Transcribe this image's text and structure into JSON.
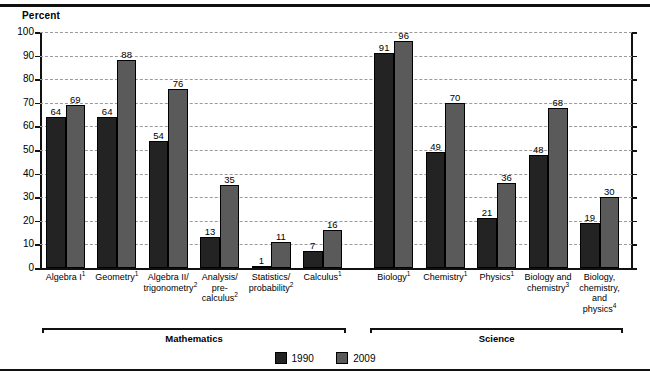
{
  "axis_title": "Percent",
  "legend": {
    "items": [
      {
        "label": "1990",
        "color": "#232323"
      },
      {
        "label": "2009",
        "color": "#5a5a5a"
      }
    ]
  },
  "groups": [
    {
      "name": "Mathematics"
    },
    {
      "name": "Science"
    }
  ],
  "chart_data": {
    "type": "bar",
    "title": "",
    "subtitle": "",
    "xlabel": "",
    "ylabel": "Percent",
    "ylim": [
      0,
      100
    ],
    "yticks": [
      0,
      10,
      20,
      30,
      40,
      50,
      60,
      70,
      80,
      90,
      100
    ],
    "grid": true,
    "legend_position": "bottom-center",
    "categories": [
      "Algebra I¹",
      "Geometry¹",
      "Algebra II/ trigonometry²",
      "Analysis/ pre- calculus²",
      "Statistics/ probability²",
      "Calculus¹",
      "Biology¹",
      "Chemistry¹",
      "Physics¹",
      "Biology and chemistry³",
      "Biology, chemistry, and physics⁴"
    ],
    "category_lines": [
      [
        "Algebra I",
        "1"
      ],
      [
        "Geometry",
        "1"
      ],
      [
        "Algebra II/",
        "trigonometry",
        "2"
      ],
      [
        "Analysis/",
        "pre-",
        "calculus",
        "2"
      ],
      [
        "Statistics/",
        "probability",
        "2"
      ],
      [
        "Calculus",
        "1"
      ],
      [
        "Biology",
        "1"
      ],
      [
        "Chemistry",
        "1"
      ],
      [
        "Physics",
        "1"
      ],
      [
        "Biology and",
        "chemistry",
        "3"
      ],
      [
        "Biology,",
        "chemistry,",
        "and",
        "physics",
        "4"
      ]
    ],
    "group_spans": [
      {
        "name": "Mathematics",
        "from": 0,
        "to": 5
      },
      {
        "name": "Science",
        "from": 6,
        "to": 10
      }
    ],
    "series": [
      {
        "name": "1990",
        "color": "#232323",
        "values": [
          64,
          64,
          54,
          13,
          1,
          7,
          91,
          49,
          21,
          48,
          19
        ]
      },
      {
        "name": "2009",
        "color": "#5a5a5a",
        "values": [
          69,
          88,
          76,
          35,
          11,
          16,
          96,
          70,
          36,
          68,
          30
        ]
      }
    ]
  }
}
